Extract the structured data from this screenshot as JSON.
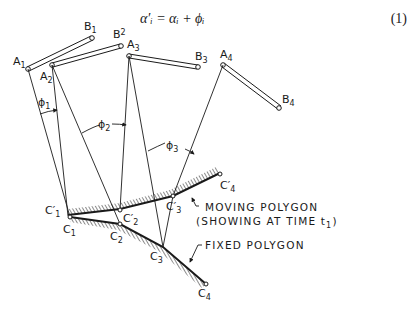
{
  "equation": {
    "text": "α′ᵢ = αᵢ + ϕᵢ",
    "number": "(1)"
  },
  "points": {
    "A": [
      {
        "label": "A",
        "sub": "1"
      },
      {
        "label": "A",
        "sub": "2"
      },
      {
        "label": "A",
        "sub": "3"
      },
      {
        "label": "A",
        "sub": "4"
      }
    ],
    "B": [
      {
        "label": "B",
        "sub": "1"
      },
      {
        "label": "B",
        "sub": "2"
      },
      {
        "label": "B",
        "sub": "3"
      },
      {
        "label": "B",
        "sub": "4"
      }
    ],
    "C": [
      {
        "label": "C",
        "sub": "1"
      },
      {
        "label": "C",
        "sub": "2"
      },
      {
        "label": "C",
        "sub": "3"
      },
      {
        "label": "C",
        "sub": "4"
      }
    ],
    "C_prime": [
      {
        "label": "C′",
        "sub": "1"
      },
      {
        "label": "C′",
        "sub": "2"
      },
      {
        "label": "C′",
        "sub": "3"
      },
      {
        "label": "C′",
        "sub": "4"
      }
    ]
  },
  "angles": [
    {
      "label": "ϕ",
      "sub": "1"
    },
    {
      "label": "ϕ",
      "sub": "2"
    },
    {
      "label": "ϕ",
      "sub": "3"
    }
  ],
  "annotations": {
    "moving_line1": "MOVING POLYGON",
    "moving_line2": "(SHOWING AT TIME t",
    "moving_sub": "1",
    "moving_close": ")",
    "fixed": "FIXED POLYGON"
  },
  "colors": {
    "ink": "#1a1a1a",
    "background": "#ffffff"
  }
}
